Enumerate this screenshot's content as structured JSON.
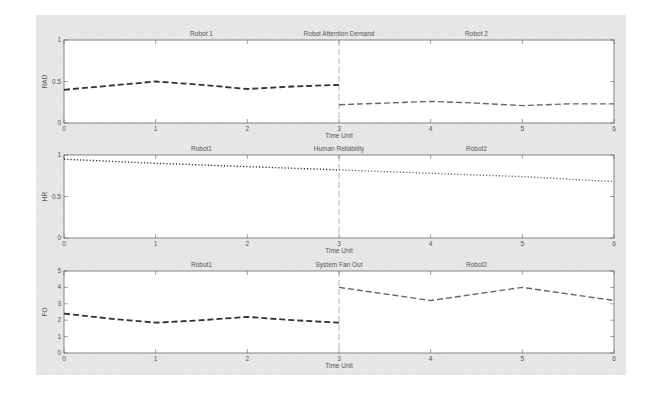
{
  "chart_data": [
    {
      "type": "line",
      "title": "Robot Attention Demand",
      "section_labels": [
        "Robot 1",
        "Robot 2"
      ],
      "xlabel": "Time Unit",
      "ylabel": "RAD",
      "xlim": [
        0,
        6
      ],
      "ylim": [
        0,
        1
      ],
      "xticks": [
        "0",
        "1",
        "2",
        "3",
        "4",
        "5",
        "6"
      ],
      "yticks": [
        "0",
        "0.5",
        "1"
      ],
      "divider_x": 3,
      "line_style": "dashed",
      "series": [
        {
          "name": "Robot 1",
          "x": [
            0,
            0.5,
            1,
            1.5,
            2,
            2.5,
            3
          ],
          "y": [
            0.4,
            0.45,
            0.5,
            0.46,
            0.41,
            0.44,
            0.46
          ]
        },
        {
          "name": "Robot 2",
          "x": [
            3,
            3.5,
            4,
            4.5,
            5,
            5.5,
            6
          ],
          "y": [
            0.22,
            0.24,
            0.26,
            0.24,
            0.21,
            0.23,
            0.23
          ]
        }
      ]
    },
    {
      "type": "line",
      "title": "Human Reliability",
      "section_labels": [
        "Robot1",
        "Robot2"
      ],
      "xlabel": "Time Unit",
      "ylabel": "HR",
      "xlim": [
        0,
        6
      ],
      "ylim": [
        0,
        1
      ],
      "xticks": [
        "0",
        "1",
        "2",
        "3",
        "4",
        "5",
        "6"
      ],
      "yticks": [
        "0",
        "0.5",
        "1"
      ],
      "divider_x": 3,
      "line_style": "dotted",
      "series": [
        {
          "name": "Robot1",
          "x": [
            0,
            1,
            2,
            3
          ],
          "y": [
            0.95,
            0.9,
            0.86,
            0.82
          ]
        },
        {
          "name": "Robot2",
          "x": [
            3,
            4,
            5,
            6
          ],
          "y": [
            0.82,
            0.78,
            0.74,
            0.68
          ]
        }
      ]
    },
    {
      "type": "line",
      "title": "System Fan Out",
      "section_labels": [
        "Robot1",
        "Robot2"
      ],
      "xlabel": "Time Unit",
      "ylabel": "FO",
      "xlim": [
        0,
        6
      ],
      "ylim": [
        0,
        5
      ],
      "xticks": [
        "0",
        "1",
        "2",
        "3",
        "4",
        "5",
        "6"
      ],
      "yticks": [
        "0",
        "1",
        "2",
        "3",
        "4",
        "5"
      ],
      "divider_x": 3,
      "line_style": "dashed",
      "series": [
        {
          "name": "Robot1",
          "x": [
            0,
            0.5,
            1,
            1.5,
            2,
            2.5,
            3
          ],
          "y": [
            2.4,
            2.1,
            1.85,
            2.0,
            2.2,
            2.0,
            1.85
          ]
        },
        {
          "name": "Robot2",
          "x": [
            3,
            4,
            5,
            6
          ],
          "y": [
            4.0,
            3.2,
            4.0,
            3.2
          ]
        }
      ]
    }
  ]
}
